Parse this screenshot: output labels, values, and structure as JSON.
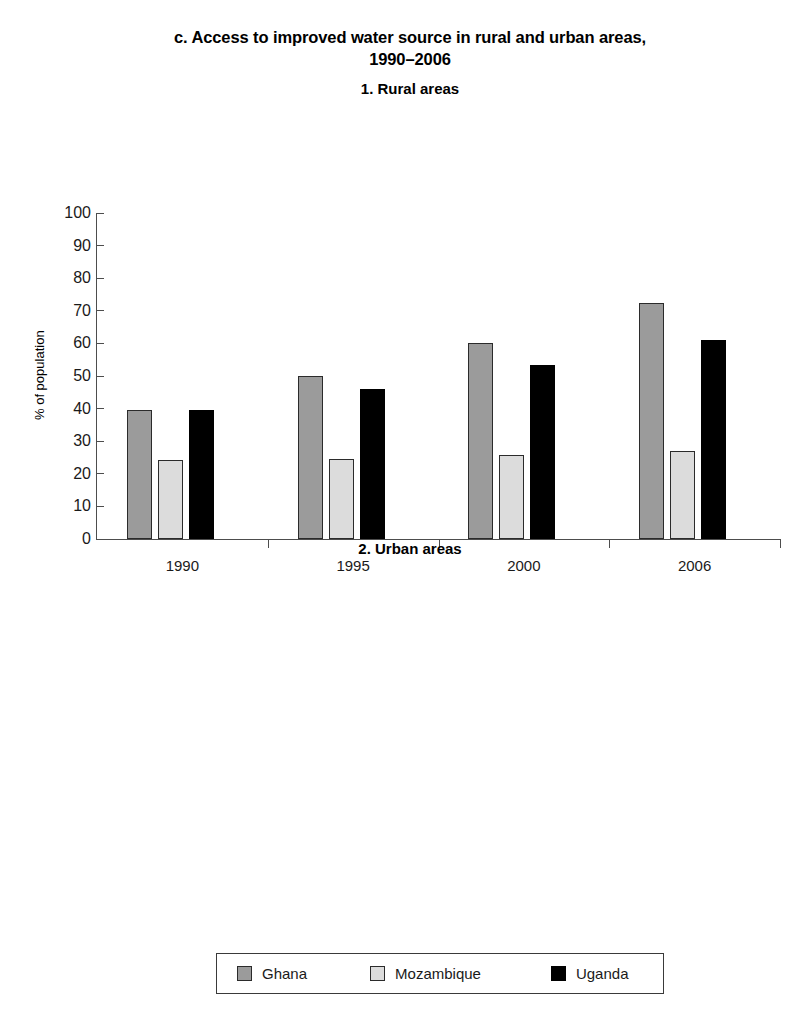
{
  "figure": {
    "title_line1": "c. Access to improved water source in rural and urban areas,",
    "title_line2": "1990–2006"
  },
  "chart_data": [
    {
      "type": "bar",
      "title": "1. Rural areas",
      "xlabel": "",
      "ylabel": "% of population",
      "categories": [
        "1990",
        "1995",
        "2000",
        "2006"
      ],
      "ylim": [
        0,
        100
      ],
      "yticks": [
        0,
        10,
        20,
        30,
        40,
        50,
        60,
        70,
        80,
        90,
        100
      ],
      "grid": false,
      "legend_position": "bottom",
      "series": [
        {
          "name": "Ghana",
          "color": "#9b9b9b",
          "values": [
            39.5,
            50.0,
            60.0,
            72.5
          ]
        },
        {
          "name": "Mozambique",
          "color": "#dcdcdc",
          "values": [
            24.3,
            24.5,
            25.7,
            27.0
          ]
        },
        {
          "name": "Uganda",
          "color": "#000000",
          "values": [
            39.7,
            46.0,
            53.3,
            61.0
          ]
        }
      ]
    },
    {
      "type": "bar",
      "title": "2. Urban areas",
      "xlabel": "",
      "ylabel": "% of population",
      "categories": [
        "1990",
        "1995",
        "2000",
        "2006"
      ],
      "ylim": [
        0,
        100
      ],
      "yticks": [
        0,
        10,
        20,
        30,
        40,
        50,
        60,
        70,
        80,
        90,
        100
      ],
      "grid": false,
      "legend_position": "bottom",
      "series": [
        {
          "name": "Ghana",
          "color": "#9b9b9b",
          "values": [
            86.5,
            88.0,
            89.3,
            91.0
          ]
        },
        {
          "name": "Mozambique",
          "color": "#dcdcdc",
          "values": [
            83.5,
            84.0,
            78.0,
            72.0
          ]
        },
        {
          "name": "Uganda",
          "color": "#000000",
          "values": [
            78.5,
            81.5,
            86.0,
            91.0
          ]
        }
      ]
    }
  ],
  "legend": {
    "items": [
      {
        "label": "Ghana",
        "color": "#9b9b9b"
      },
      {
        "label": "Mozambique",
        "color": "#dcdcdc"
      },
      {
        "label": "Uganda",
        "color": "#000000"
      }
    ]
  }
}
